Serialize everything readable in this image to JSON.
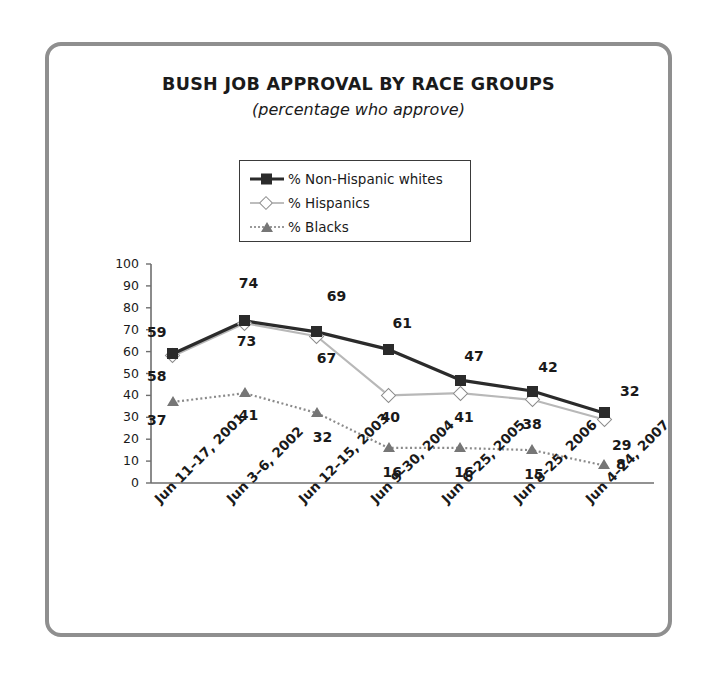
{
  "chart_data": {
    "type": "line",
    "title": "BUSH JOB APPROVAL BY RACE GROUPS",
    "subtitle": "(percentage who approve)",
    "xlabel": "",
    "ylabel": "",
    "ylim": [
      0,
      100
    ],
    "ytick_step": 10,
    "grid": false,
    "legend_position": "top-center",
    "categories": [
      "Jun 11–17, 2001",
      "Jun 3–6, 2002",
      "Jun 12–15, 2003",
      "Jun 9–30, 2004",
      "Jun 6–25, 2005",
      "Jun 8–25, 2006",
      "Jun 4–24, 2007"
    ],
    "yticks": [
      "0",
      "10",
      "20",
      "30",
      "40",
      "50",
      "60",
      "70",
      "80",
      "90",
      "100"
    ],
    "series": [
      {
        "name": "% Non-Hispanic whites",
        "marker": "filled-square",
        "color": "#2b2b2b",
        "line": "solid",
        "values": [
          59,
          74,
          69,
          61,
          47,
          42,
          32
        ]
      },
      {
        "name": "% Hispanics",
        "marker": "open-diamond",
        "color": "#b8b8b8",
        "line": "solid",
        "values": [
          58,
          73,
          67,
          40,
          41,
          38,
          29
        ]
      },
      {
        "name": "% Blacks",
        "marker": "filled-triangle",
        "color": "#8a8a8a",
        "line": "dotted",
        "values": [
          37,
          41,
          32,
          16,
          16,
          15,
          8
        ]
      }
    ]
  },
  "colors": {
    "frame_border": "#8f8f8f",
    "axis": "#6e6e6e",
    "text": "#1a1a1a",
    "whites": "#2b2b2b",
    "hispanics": "#b8b8b8",
    "blacks": "#8a8a8a"
  }
}
